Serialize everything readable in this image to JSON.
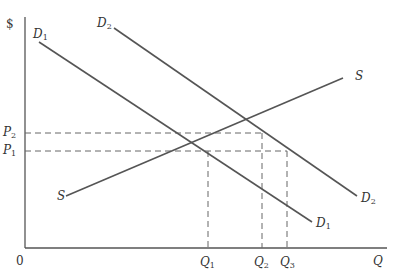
{
  "diagram": {
    "type": "supply-demand",
    "axes": {
      "y_label": "$",
      "x_label": "Q",
      "origin_label": "0"
    },
    "curves": [
      {
        "id": "D1",
        "name": "D",
        "sub": "1",
        "from": [
          39,
          42
        ],
        "to": [
          312,
          222
        ]
      },
      {
        "id": "D2",
        "name": "D",
        "sub": "2",
        "from": [
          114,
          28
        ],
        "to": [
          357,
          196
        ]
      },
      {
        "id": "S",
        "name": "S",
        "sub": "",
        "from": [
          66,
          196
        ],
        "to": [
          343,
          78
        ]
      }
    ],
    "price_levels": [
      {
        "name": "P",
        "sub": "2",
        "y": 133,
        "x_end": 262
      },
      {
        "name": "P",
        "sub": "1",
        "y": 151,
        "x_end": 287
      }
    ],
    "quantity_levels": [
      {
        "name": "Q",
        "sub": "1",
        "x": 208,
        "y_start": 151
      },
      {
        "name": "Q",
        "sub": "2",
        "x": 262,
        "y_start": 133
      },
      {
        "name": "Q",
        "sub": "3",
        "x": 287,
        "y_start": 151
      }
    ],
    "colors": {
      "line": "#555555",
      "dash": "#666666",
      "text": "#333333"
    }
  }
}
